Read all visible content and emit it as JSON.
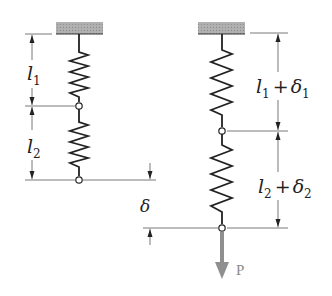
{
  "figure": {
    "left_system": {
      "label_l1": {
        "main": "l",
        "sub": "1"
      },
      "label_l2": {
        "main": "l",
        "sub": "2"
      },
      "label_delta": "δ"
    },
    "right_system": {
      "label_top": {
        "main": "l",
        "sub": "1",
        "plus": "+",
        "delta": "δ",
        "delta_sub": "1"
      },
      "label_bottom": {
        "main": "l",
        "sub": "2",
        "plus": "+",
        "delta": "δ",
        "delta_sub": "2"
      },
      "load_label": "P"
    }
  },
  "colors": {
    "line": "#222222",
    "support_fill": "#a8a8a8",
    "load_arrow": "#8f8f8f",
    "dim_line": "#555555"
  }
}
